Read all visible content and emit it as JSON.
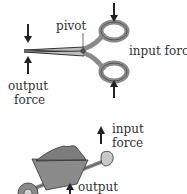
{
  "scissors": {
    "pivot_label": "pivot",
    "input_label": "input force",
    "output_label_line1": "output",
    "output_label_line2": "force"
  },
  "wheelbarrow": {
    "input_label_line1": "input",
    "input_label_line2": "force",
    "output_label": "output"
  },
  "colors": {
    "fill_gray": "#8a8a8a",
    "stroke": "#333333"
  }
}
